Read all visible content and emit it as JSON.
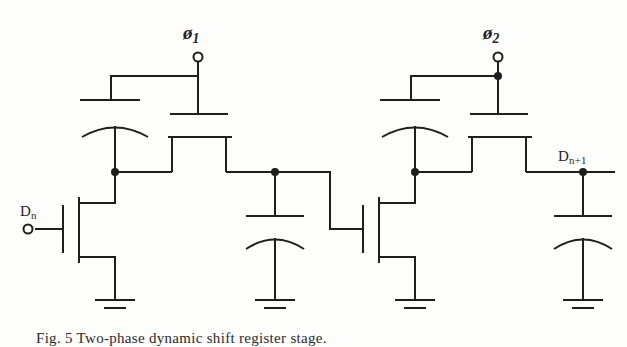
{
  "figure": {
    "kind": "circuit-schematic",
    "caption": "Fig. 5  Two-phase dynamic shift register stage.",
    "ink_color": "#1f1f1f",
    "background_color": "#fdfdfc",
    "line_width": 2
  },
  "labels": {
    "clock1": {
      "symbol": "ø",
      "subscript": "1",
      "name": "phi-1"
    },
    "clock2": {
      "symbol": "ø",
      "subscript": "2",
      "name": "phi-2"
    },
    "input": {
      "symbol": "D",
      "subscript": "n",
      "name": "data-in"
    },
    "output": {
      "symbol": "D",
      "subscript": "n+1",
      "name": "data-out"
    }
  },
  "terminals": [
    {
      "id": "phi1-terminal",
      "label": "ø1",
      "type": "open-circle",
      "x": 198,
      "y": 57
    },
    {
      "id": "phi2-terminal",
      "label": "ø2",
      "type": "open-circle",
      "x": 498,
      "y": 57
    },
    {
      "id": "input-terminal",
      "label": "Dn",
      "type": "open-circle",
      "x": 28,
      "y": 228
    },
    {
      "id": "output-terminal",
      "label": "Dn+1",
      "type": "solid-node",
      "x": 583,
      "y": 172
    }
  ],
  "nodes": [
    {
      "id": "stage1-internal-node",
      "x": 115,
      "y": 172,
      "type": "junction"
    },
    {
      "id": "stage1-output-node",
      "x": 275,
      "y": 172,
      "type": "junction"
    },
    {
      "id": "stage2-internal-node",
      "x": 415,
      "y": 172,
      "type": "junction"
    },
    {
      "id": "stage2-output-node",
      "x": 583,
      "y": 172,
      "type": "junction"
    },
    {
      "id": "phi2-tap-node",
      "x": 498,
      "y": 76,
      "type": "junction"
    }
  ],
  "components": {
    "stage1": {
      "load_transistor": {
        "name": "load-transistor-1",
        "gate_source": "ø1"
      },
      "storage_capacitor": {
        "name": "storage-capacitor-1",
        "style": "curved-plate"
      },
      "driver_transistor": {
        "name": "driver-transistor-1",
        "gate_source": "Dn"
      },
      "pass_transistor": {
        "name": "pass-transistor-1",
        "gate_source": "ø1"
      },
      "ground_symbols": 1
    },
    "stage1_output": {
      "storage_capacitor": {
        "name": "output-capacitor-1",
        "style": "curved-plate"
      },
      "ground_symbols": 1
    },
    "stage2": {
      "load_transistor": {
        "name": "load-transistor-2",
        "gate_source": "ø2"
      },
      "storage_capacitor": {
        "name": "storage-capacitor-2",
        "style": "curved-plate"
      },
      "driver_transistor": {
        "name": "driver-transistor-2",
        "gate_source": "stage1-output-node"
      },
      "pass_transistor": {
        "name": "pass-transistor-2",
        "gate_source": "ø2"
      },
      "ground_symbols": 1
    },
    "stage2_output": {
      "storage_capacitor": {
        "name": "output-capacitor-2",
        "style": "curved-plate"
      },
      "ground_symbols": 1
    }
  }
}
